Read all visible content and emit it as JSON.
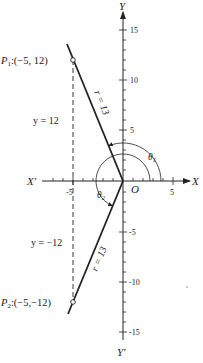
{
  "diagram": {
    "type": "polar-coordinate-figure",
    "axes": {
      "x_label": "X",
      "x_neg_label": "X′",
      "y_label": "Y",
      "y_neg_label": "Y′",
      "origin_label": "O",
      "x_ticks": {
        "labels": [
          "-5",
          "5"
        ]
      },
      "y_ticks": {
        "labels": [
          "15",
          "10",
          "5",
          "-5",
          "-10",
          "-15"
        ]
      }
    },
    "points": [
      {
        "id": "P1",
        "name": "P",
        "sub": "1",
        "coords": ":(−5, 12)",
        "x": -5,
        "y": 12
      },
      {
        "id": "P2",
        "name": "P",
        "sub": "2",
        "coords": ":(−5,−12)",
        "x": -5,
        "y": -12
      }
    ],
    "radius_labels": {
      "r1": "r = 13",
      "r2": "r = 13"
    },
    "dashed_labels": {
      "upper": "y = 12",
      "lower": "y = −12"
    },
    "angles": {
      "theta1": {
        "name": "θ",
        "sub": "1"
      },
      "theta2": {
        "name": "θ",
        "sub": "2"
      }
    },
    "colors": {
      "ink": "#222222",
      "background": "#ffffff"
    }
  }
}
